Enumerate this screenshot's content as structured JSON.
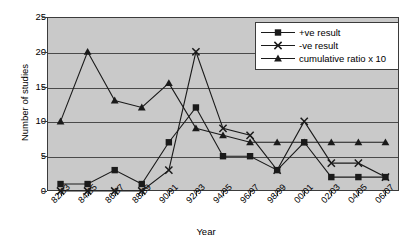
{
  "chart_data": {
    "type": "line",
    "title": "",
    "xlabel": "Year",
    "ylabel": "Number of studies",
    "categories": [
      "82/83",
      "84/85",
      "86/87",
      "88/89",
      "90/91",
      "92/93",
      "94/95",
      "96/97",
      "98/99",
      "00/01",
      "02/03",
      "04/05",
      "06/07"
    ],
    "ylim": [
      0,
      25
    ],
    "yticks": [
      0,
      5,
      10,
      15,
      20,
      25
    ],
    "grid": true,
    "legend_position": "top-right",
    "plot_background": "#c9c9c9",
    "series": [
      {
        "name": "+ve result",
        "marker": "square",
        "color": "#1a1a1a",
        "values": [
          1,
          1,
          3,
          1,
          7,
          12,
          5,
          5,
          3,
          7,
          2,
          2,
          2
        ]
      },
      {
        "name": "-ve result",
        "marker": "cross",
        "color": "#1a1a1a",
        "values": [
          0,
          0,
          0,
          0,
          3,
          20,
          9,
          8,
          3,
          10,
          4,
          4,
          2
        ]
      },
      {
        "name": "cumulative ratio x 10",
        "marker": "triangle",
        "color": "#1a1a1a",
        "values": [
          10,
          20,
          13,
          12,
          15.5,
          9,
          8,
          7,
          7,
          7,
          7,
          7,
          7
        ]
      }
    ]
  }
}
